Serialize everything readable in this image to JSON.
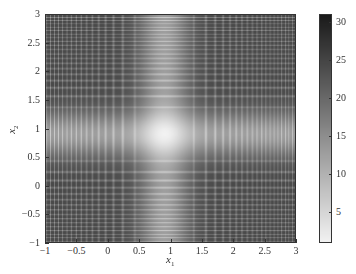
{
  "chart_data": {
    "type": "heatmap",
    "title": "",
    "xlabel": "x1",
    "ylabel": "x2",
    "xlabel_main": "x",
    "xlabel_sub": "1",
    "ylabel_main": "x",
    "ylabel_sub": "2",
    "xlim": [
      -1,
      3
    ],
    "ylim": [
      -1,
      3
    ],
    "x_ticks": [
      "-1",
      "-0.5",
      "0",
      "0.5",
      "1",
      "1.5",
      "2",
      "2.5",
      "3"
    ],
    "x_tick_values": [
      -1,
      -0.5,
      0,
      0.5,
      1,
      1.5,
      2,
      2.5,
      3
    ],
    "y_ticks": [
      "-1",
      "-0.5",
      "0",
      "0.5",
      "1",
      "1.5",
      "2",
      "2.5",
      "3"
    ],
    "y_tick_values": [
      -1,
      -0.5,
      0,
      0.5,
      1,
      1.5,
      2,
      2.5,
      3
    ],
    "colorbar": {
      "range": [
        1,
        31
      ],
      "ticks": [
        "5",
        "10",
        "15",
        "20",
        "25",
        "30"
      ],
      "tick_values": [
        5,
        10,
        15,
        20,
        25,
        30
      ],
      "colormap": "gray-reversed (white=low, black=high)",
      "low_color": "#f2f2f2",
      "high_color": "#1a1a1a"
    },
    "surface": {
      "description": "separable chirp-like oscillating function with global minimum (bright) near (0.9, 0.9); stripes become denser away from the minimum",
      "minimum_location": [
        0.9,
        0.9
      ],
      "min_value": 1,
      "max_value": 31,
      "chirp_frequency": 14
    },
    "grid": false,
    "legend": null
  }
}
